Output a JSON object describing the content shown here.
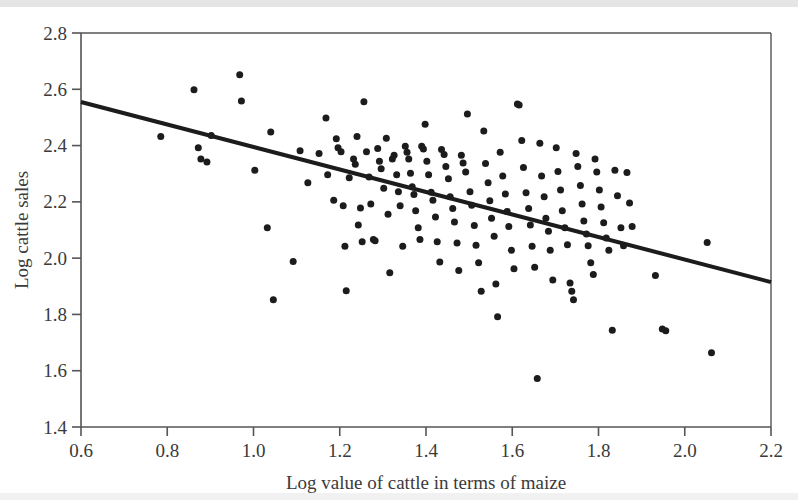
{
  "chart_data": {
    "type": "scatter",
    "title": "",
    "xlabel": "Log value of cattle in terms of maize",
    "ylabel": "Log cattle sales",
    "xlim": [
      0.6,
      2.2
    ],
    "ylim": [
      1.4,
      2.8
    ],
    "xticks": [
      "0.6",
      "0.8",
      "1.0",
      "1.2",
      "1.4",
      "1.6",
      "1.8",
      "2.0",
      "2.2"
    ],
    "yticks": [
      "1.4",
      "1.6",
      "1.8",
      "2.0",
      "2.2",
      "2.4",
      "2.6",
      "2.8"
    ],
    "xtick_values": [
      0.6,
      0.8,
      1.0,
      1.2,
      1.4,
      1.6,
      1.8,
      2.0,
      2.2
    ],
    "ytick_values": [
      1.4,
      1.6,
      1.8,
      2.0,
      2.2,
      2.4,
      2.6,
      2.8
    ],
    "grid": false,
    "legend": "none",
    "marker_color": "#1c1c1c",
    "marker_size": 7,
    "frame_color": "#555555",
    "series": [
      {
        "name": "observations",
        "points": [
          [
            0.785,
            2.432
          ],
          [
            0.862,
            2.598
          ],
          [
            0.872,
            2.392
          ],
          [
            0.878,
            2.352
          ],
          [
            0.892,
            2.342
          ],
          [
            0.902,
            2.436
          ],
          [
            0.968,
            2.652
          ],
          [
            0.972,
            2.558
          ],
          [
            1.003,
            2.312
          ],
          [
            1.032,
            2.108
          ],
          [
            1.04,
            2.448
          ],
          [
            1.046,
            1.852
          ],
          [
            1.092,
            1.988
          ],
          [
            1.108,
            2.382
          ],
          [
            1.126,
            2.268
          ],
          [
            1.152,
            2.372
          ],
          [
            1.168,
            2.498
          ],
          [
            1.172,
            2.296
          ],
          [
            1.186,
            2.206
          ],
          [
            1.192,
            2.424
          ],
          [
            1.196,
            2.392
          ],
          [
            1.203,
            2.378
          ],
          [
            1.208,
            2.186
          ],
          [
            1.212,
            2.042
          ],
          [
            1.215,
            1.884
          ],
          [
            1.222,
            2.286
          ],
          [
            1.232,
            2.352
          ],
          [
            1.236,
            2.334
          ],
          [
            1.24,
            2.432
          ],
          [
            1.243,
            2.118
          ],
          [
            1.248,
            2.178
          ],
          [
            1.252,
            2.058
          ],
          [
            1.256,
            2.556
          ],
          [
            1.262,
            2.378
          ],
          [
            1.268,
            2.288
          ],
          [
            1.272,
            2.192
          ],
          [
            1.278,
            2.066
          ],
          [
            1.282,
            2.062
          ],
          [
            1.288,
            2.39
          ],
          [
            1.292,
            2.344
          ],
          [
            1.296,
            2.318
          ],
          [
            1.302,
            2.248
          ],
          [
            1.308,
            2.426
          ],
          [
            1.312,
            2.156
          ],
          [
            1.316,
            1.948
          ],
          [
            1.322,
            2.352
          ],
          [
            1.326,
            2.366
          ],
          [
            1.332,
            2.296
          ],
          [
            1.336,
            2.236
          ],
          [
            1.34,
            2.186
          ],
          [
            1.346,
            2.042
          ],
          [
            1.352,
            2.398
          ],
          [
            1.356,
            2.376
          ],
          [
            1.36,
            2.352
          ],
          [
            1.364,
            2.302
          ],
          [
            1.368,
            2.254
          ],
          [
            1.372,
            2.226
          ],
          [
            1.376,
            2.168
          ],
          [
            1.382,
            2.108
          ],
          [
            1.386,
            2.066
          ],
          [
            1.39,
            2.398
          ],
          [
            1.394,
            2.388
          ],
          [
            1.398,
            2.476
          ],
          [
            1.402,
            2.344
          ],
          [
            1.406,
            2.296
          ],
          [
            1.412,
            2.234
          ],
          [
            1.416,
            2.206
          ],
          [
            1.422,
            2.146
          ],
          [
            1.426,
            2.058
          ],
          [
            1.432,
            1.986
          ],
          [
            1.436,
            2.386
          ],
          [
            1.442,
            2.368
          ],
          [
            1.446,
            2.326
          ],
          [
            1.452,
            2.282
          ],
          [
            1.456,
            2.218
          ],
          [
            1.462,
            2.176
          ],
          [
            1.466,
            2.128
          ],
          [
            1.472,
            2.054
          ],
          [
            1.476,
            1.956
          ],
          [
            1.482,
            2.366
          ],
          [
            1.486,
            2.338
          ],
          [
            1.492,
            2.306
          ],
          [
            1.496,
            2.512
          ],
          [
            1.502,
            2.236
          ],
          [
            1.506,
            2.188
          ],
          [
            1.512,
            2.116
          ],
          [
            1.516,
            2.046
          ],
          [
            1.522,
            1.984
          ],
          [
            1.528,
            1.882
          ],
          [
            1.534,
            2.452
          ],
          [
            1.538,
            2.336
          ],
          [
            1.544,
            2.268
          ],
          [
            1.548,
            2.204
          ],
          [
            1.552,
            2.142
          ],
          [
            1.558,
            2.078
          ],
          [
            1.562,
            1.908
          ],
          [
            1.566,
            1.792
          ],
          [
            1.572,
            2.376
          ],
          [
            1.578,
            2.292
          ],
          [
            1.584,
            2.228
          ],
          [
            1.588,
            2.166
          ],
          [
            1.592,
            2.112
          ],
          [
            1.598,
            2.028
          ],
          [
            1.604,
            1.962
          ],
          [
            1.612,
            2.548
          ],
          [
            1.616,
            2.544
          ],
          [
            1.622,
            2.418
          ],
          [
            1.626,
            2.322
          ],
          [
            1.632,
            2.232
          ],
          [
            1.638,
            2.176
          ],
          [
            1.642,
            2.118
          ],
          [
            1.646,
            2.042
          ],
          [
            1.652,
            1.968
          ],
          [
            1.658,
            1.572
          ],
          [
            1.664,
            2.408
          ],
          [
            1.668,
            2.292
          ],
          [
            1.674,
            2.218
          ],
          [
            1.678,
            2.142
          ],
          [
            1.684,
            2.096
          ],
          [
            1.688,
            2.028
          ],
          [
            1.694,
            1.922
          ],
          [
            1.702,
            2.392
          ],
          [
            1.706,
            2.308
          ],
          [
            1.712,
            2.242
          ],
          [
            1.716,
            2.168
          ],
          [
            1.722,
            2.108
          ],
          [
            1.728,
            2.048
          ],
          [
            1.734,
            1.912
          ],
          [
            1.738,
            1.882
          ],
          [
            1.742,
            1.852
          ],
          [
            1.748,
            2.372
          ],
          [
            1.752,
            2.326
          ],
          [
            1.758,
            2.258
          ],
          [
            1.762,
            2.192
          ],
          [
            1.766,
            2.132
          ],
          [
            1.772,
            2.086
          ],
          [
            1.776,
            2.044
          ],
          [
            1.782,
            1.984
          ],
          [
            1.788,
            1.942
          ],
          [
            1.792,
            2.352
          ],
          [
            1.796,
            2.306
          ],
          [
            1.802,
            2.242
          ],
          [
            1.806,
            2.182
          ],
          [
            1.812,
            2.126
          ],
          [
            1.818,
            2.072
          ],
          [
            1.824,
            2.028
          ],
          [
            1.832,
            1.744
          ],
          [
            1.838,
            2.312
          ],
          [
            1.844,
            2.222
          ],
          [
            1.852,
            2.108
          ],
          [
            1.858,
            2.044
          ],
          [
            1.866,
            2.304
          ],
          [
            1.872,
            2.196
          ],
          [
            1.878,
            2.112
          ],
          [
            1.932,
            1.938
          ],
          [
            1.948,
            1.748
          ],
          [
            1.956,
            1.742
          ],
          [
            2.052,
            2.056
          ],
          [
            2.062,
            1.664
          ]
        ]
      }
    ],
    "fit_line": {
      "name": "regression-line",
      "x": [
        0.6,
        2.2
      ],
      "y": [
        2.555,
        1.915
      ],
      "slope": -0.4,
      "intercept": 2.795,
      "color": "#1c1c1c",
      "width": 4
    }
  },
  "axes": {
    "xlabel": "Log value of cattle in terms of maize",
    "ylabel": "Log cattle sales"
  }
}
